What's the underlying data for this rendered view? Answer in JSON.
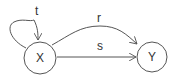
{
  "diagram": {
    "type": "state-diagram",
    "nodes": [
      {
        "id": "X",
        "label": "X"
      },
      {
        "id": "Y",
        "label": "Y"
      }
    ],
    "edges": [
      {
        "from": "X",
        "to": "X",
        "label": "t",
        "kind": "self-loop"
      },
      {
        "from": "X",
        "to": "Y",
        "label": "r",
        "kind": "curved"
      },
      {
        "from": "X",
        "to": "Y",
        "label": "s",
        "kind": "straight"
      }
    ],
    "colors": {
      "stroke": "#555555",
      "text": "#333333"
    }
  }
}
